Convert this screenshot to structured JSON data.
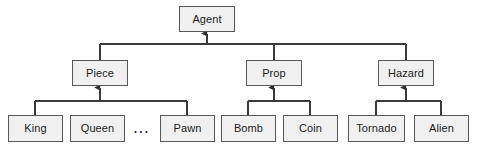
{
  "diagram": {
    "type": "class-hierarchy",
    "style": {
      "box_fill": "#f0f0f0",
      "box_border": "#575757",
      "edge_color": "#3a3a3a",
      "text_color": "#1c1c1c",
      "background": "#ffffff"
    },
    "nodes": {
      "agent": {
        "label": "Agent",
        "x": 179,
        "y": 6,
        "w": 56,
        "h": 26,
        "level": 0
      },
      "piece": {
        "label": "Piece",
        "x": 72,
        "y": 60,
        "w": 56,
        "h": 26,
        "level": 1
      },
      "prop": {
        "label": "Prop",
        "x": 246,
        "y": 60,
        "w": 56,
        "h": 26,
        "level": 1
      },
      "hazard": {
        "label": "Hazard",
        "x": 378,
        "y": 60,
        "w": 56,
        "h": 26,
        "level": 1
      },
      "king": {
        "label": "King",
        "x": 8,
        "y": 115,
        "w": 55,
        "h": 27,
        "level": 2
      },
      "queen": {
        "label": "Queen",
        "x": 70,
        "y": 115,
        "w": 55,
        "h": 27,
        "level": 2
      },
      "pawn": {
        "label": "Pawn",
        "x": 160,
        "y": 115,
        "w": 55,
        "h": 27,
        "level": 2
      },
      "bomb": {
        "label": "Bomb",
        "x": 221,
        "y": 115,
        "w": 55,
        "h": 27,
        "level": 2
      },
      "coin": {
        "label": "Coin",
        "x": 283,
        "y": 115,
        "w": 55,
        "h": 27,
        "level": 2
      },
      "tornado": {
        "label": "Tornado",
        "x": 348,
        "y": 115,
        "w": 57,
        "h": 27,
        "level": 2
      },
      "alien": {
        "label": "Alien",
        "x": 414,
        "y": 115,
        "w": 55,
        "h": 27,
        "level": 2
      }
    },
    "ellipsis": {
      "label": "...",
      "x": 128,
      "y": 120,
      "w": 28,
      "h": 18,
      "meaning": "additional piece subclasses omitted"
    },
    "edges": [
      {
        "from": "piece",
        "to": "agent",
        "relation": "generalization"
      },
      {
        "from": "prop",
        "to": "agent",
        "relation": "generalization"
      },
      {
        "from": "hazard",
        "to": "agent",
        "relation": "generalization"
      },
      {
        "from": "king",
        "to": "piece",
        "relation": "generalization"
      },
      {
        "from": "pawn",
        "to": "piece",
        "relation": "generalization"
      },
      {
        "from": "bomb",
        "to": "prop",
        "relation": "generalization"
      },
      {
        "from": "coin",
        "to": "prop",
        "relation": "generalization"
      },
      {
        "from": "tornado",
        "to": "hazard",
        "relation": "generalization"
      },
      {
        "from": "alien",
        "to": "hazard",
        "relation": "generalization"
      }
    ],
    "buses": [
      {
        "name": "agent-bus",
        "parent": "agent",
        "y": 44,
        "x1": 100,
        "x2": 406,
        "arrow_x": 207
      },
      {
        "name": "piece-bus",
        "parent": "piece",
        "y": 101,
        "x1": 35,
        "x2": 187,
        "arrow_x": 100
      },
      {
        "name": "prop-bus",
        "parent": "prop",
        "y": 101,
        "x1": 248,
        "x2": 310,
        "arrow_x": 274
      },
      {
        "name": "hazard-bus",
        "parent": "hazard",
        "y": 101,
        "x1": 376,
        "x2": 441,
        "arrow_x": 406
      }
    ]
  }
}
